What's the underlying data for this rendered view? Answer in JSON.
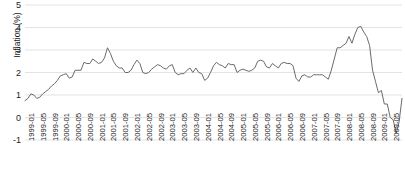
{
  "chart_data": {
    "type": "line",
    "title": "",
    "xlabel": "",
    "ylabel": "Inflation (%)",
    "ylim": [
      -1,
      5
    ],
    "yticks": [
      5,
      4,
      3,
      2,
      1,
      0,
      -1
    ],
    "ytick_labels": [
      "5",
      "4",
      "3",
      "2",
      "1",
      "0",
      "-1"
    ],
    "grid": true,
    "grid_axis": "y",
    "legend": "none",
    "line_color": "#6b6b6b",
    "grid_color": "#e3e3e3",
    "text_color": "#1c1c1c",
    "background_color": "#ffffff",
    "x_tick_interval_months": 4,
    "xtick_labels": [
      "1999-01",
      "1999-05",
      "1999-09",
      "2000-01",
      "2000-05",
      "2000-09",
      "2001-01",
      "2001-05",
      "2001-09",
      "2002-01",
      "2002-05",
      "2002-09",
      "2003-01",
      "2003-05",
      "2003-09",
      "2004-01",
      "2004-05",
      "2004-09",
      "2005-01",
      "2005-05",
      "2005-09",
      "2006-01",
      "2006-05",
      "2006-09",
      "2007-01",
      "2007-05",
      "2007-09",
      "2008-01",
      "2008-05",
      "2008-09",
      "2009-01",
      "2009-05",
      "2009-09"
    ],
    "x": [
      "1999-01",
      "1999-02",
      "1999-03",
      "1999-04",
      "1999-05",
      "1999-06",
      "1999-07",
      "1999-08",
      "1999-09",
      "1999-10",
      "1999-11",
      "1999-12",
      "2000-01",
      "2000-02",
      "2000-03",
      "2000-04",
      "2000-05",
      "2000-06",
      "2000-07",
      "2000-08",
      "2000-09",
      "2000-10",
      "2000-11",
      "2000-12",
      "2001-01",
      "2001-02",
      "2001-03",
      "2001-04",
      "2001-05",
      "2001-06",
      "2001-07",
      "2001-08",
      "2001-09",
      "2001-10",
      "2001-11",
      "2001-12",
      "2002-01",
      "2002-02",
      "2002-03",
      "2002-04",
      "2002-05",
      "2002-06",
      "2002-07",
      "2002-08",
      "2002-09",
      "2002-10",
      "2002-11",
      "2002-12",
      "2003-01",
      "2003-02",
      "2003-03",
      "2003-04",
      "2003-05",
      "2003-06",
      "2003-07",
      "2003-08",
      "2003-09",
      "2003-10",
      "2003-11",
      "2003-12",
      "2004-01",
      "2004-02",
      "2004-03",
      "2004-04",
      "2004-05",
      "2004-06",
      "2004-07",
      "2004-08",
      "2004-09",
      "2004-10",
      "2004-11",
      "2004-12",
      "2005-01",
      "2005-02",
      "2005-03",
      "2005-04",
      "2005-05",
      "2005-06",
      "2005-07",
      "2005-08",
      "2005-09",
      "2005-10",
      "2005-11",
      "2005-12",
      "2006-01",
      "2006-02",
      "2006-03",
      "2006-04",
      "2006-05",
      "2006-06",
      "2006-07",
      "2006-08",
      "2006-09",
      "2006-10",
      "2006-11",
      "2006-12",
      "2007-01",
      "2007-02",
      "2007-03",
      "2007-04",
      "2007-05",
      "2007-06",
      "2007-07",
      "2007-08",
      "2007-09",
      "2007-10",
      "2007-11",
      "2007-12",
      "2008-01",
      "2008-02",
      "2008-03",
      "2008-04",
      "2008-05",
      "2008-06",
      "2008-07",
      "2008-08",
      "2008-09",
      "2008-10",
      "2008-11",
      "2008-12",
      "2009-01",
      "2009-02",
      "2009-03",
      "2009-04",
      "2009-05",
      "2009-06",
      "2009-07",
      "2009-08",
      "2009-09"
    ],
    "values": [
      0.75,
      0.85,
      1.05,
      1.0,
      0.85,
      0.9,
      1.05,
      1.15,
      1.25,
      1.4,
      1.5,
      1.65,
      1.85,
      1.9,
      1.95,
      1.75,
      1.8,
      2.1,
      2.1,
      2.1,
      2.45,
      2.4,
      2.4,
      2.6,
      2.5,
      2.4,
      2.45,
      2.65,
      3.1,
      2.85,
      2.5,
      2.3,
      2.2,
      2.2,
      2.0,
      2.0,
      2.1,
      2.35,
      2.55,
      2.4,
      2.0,
      1.95,
      2.0,
      2.15,
      2.25,
      2.35,
      2.3,
      2.2,
      2.15,
      2.3,
      2.35,
      2.0,
      1.9,
      1.95,
      1.95,
      2.1,
      2.2,
      2.0,
      2.2,
      2.0,
      1.95,
      1.65,
      1.75,
      2.0,
      2.3,
      2.45,
      2.35,
      2.3,
      2.2,
      2.4,
      2.35,
      2.35,
      2.0,
      2.1,
      2.15,
      2.1,
      2.05,
      2.1,
      2.2,
      2.5,
      2.55,
      2.5,
      2.25,
      2.2,
      2.4,
      2.3,
      2.2,
      2.4,
      2.45,
      2.4,
      2.4,
      2.3,
      1.75,
      1.6,
      1.85,
      1.9,
      1.8,
      1.8,
      1.9,
      1.9,
      1.9,
      1.9,
      1.8,
      1.7,
      2.1,
      2.6,
      3.1,
      3.1,
      3.2,
      3.3,
      3.6,
      3.3,
      3.7,
      4.0,
      4.05,
      3.8,
      3.6,
      3.2,
      2.1,
      1.6,
      1.1,
      1.2,
      0.6,
      0.6,
      0.0,
      -0.1,
      -0.7,
      -0.2,
      0.85
    ]
  }
}
